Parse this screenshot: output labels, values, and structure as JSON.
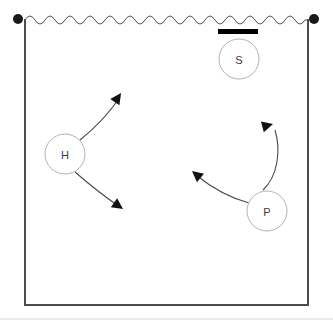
{
  "scene": {
    "title": "Volleyball court movement diagram",
    "background_color": "#ffffff",
    "court": {
      "name": "court-boundary",
      "left": 25,
      "top": 19,
      "right": 308,
      "bottom": 305,
      "stroke_color": "#4d4d4d",
      "stroke_width": 2
    },
    "net": {
      "name": "net-wave",
      "y": 20,
      "x_start": 25,
      "x_end": 308,
      "wavelength": 20,
      "amplitude": 4,
      "stroke_color": "#555555",
      "stroke_width": 1
    },
    "net_posts": [
      {
        "name": "net-post-left",
        "cx": 18,
        "cy": 19,
        "r": 5,
        "color": "#1a1a1a"
      },
      {
        "name": "net-post-right",
        "cx": 314,
        "cy": 19,
        "r": 5,
        "color": "#1a1a1a"
      }
    ],
    "bar": {
      "name": "blocked-zone-bar",
      "x": 218,
      "y": 29,
      "width": 40,
      "height": 5,
      "color": "#000000"
    },
    "baseline": {
      "name": "page-baseline-rule",
      "y": 319,
      "x_start": 0,
      "x_end": 333,
      "color": "#d4d4d4"
    }
  },
  "players": [
    {
      "id": "hitter",
      "name": "player-node-h",
      "label": "H",
      "cx": 65,
      "cy": 154,
      "r": 20,
      "stroke_color": "#b3b3b3",
      "fill_color": "#ffffff",
      "text_color": "#3c3c3c"
    },
    {
      "id": "setter",
      "name": "player-node-s",
      "label": "S",
      "cx": 239,
      "cy": 59,
      "r": 20,
      "stroke_color": "#b3b3b3",
      "fill_color": "#ffffff",
      "text_color": "#3c3c3c"
    },
    {
      "id": "passer",
      "name": "player-node-p",
      "label": "P",
      "cx": 267,
      "cy": 211,
      "r": 20,
      "stroke_color": "#b3b3b3",
      "fill_color": "#ffffff",
      "text_color": "#3c3c3c"
    }
  ],
  "arrows": [
    {
      "id": "h-upper",
      "name": "movement-arrow-h-upper",
      "from": "hitter",
      "path": "M 80 140 C 95 128 110 112 120 97",
      "head_at": [
        121,
        93
      ],
      "head_angle": -56,
      "stroke_color": "#4a4a4a",
      "stroke_width": 1.1
    },
    {
      "id": "h-lower",
      "name": "movement-arrow-h-lower",
      "from": "hitter",
      "path": "M 75 172 C 90 185 105 197 120 207",
      "head_at": [
        123,
        209
      ],
      "head_angle": 35,
      "stroke_color": "#4a4a4a",
      "stroke_width": 1.1
    },
    {
      "id": "p-left",
      "name": "movement-arrow-p-left",
      "from": "passer",
      "path": "M 249 203 C 231 198 212 188 196 175",
      "head_at": [
        192,
        171
      ],
      "head_angle": -140,
      "stroke_color": "#4a4a4a",
      "stroke_width": 1.1
    },
    {
      "id": "p-up",
      "name": "movement-arrow-p-up",
      "from": "passer",
      "path": "M 263 190 C 278 176 281 150 275 130",
      "head_at": [
        273,
        124
      ],
      "head_angle": -15,
      "stroke_color": "#4a4a4a",
      "stroke_width": 1.1
    }
  ]
}
